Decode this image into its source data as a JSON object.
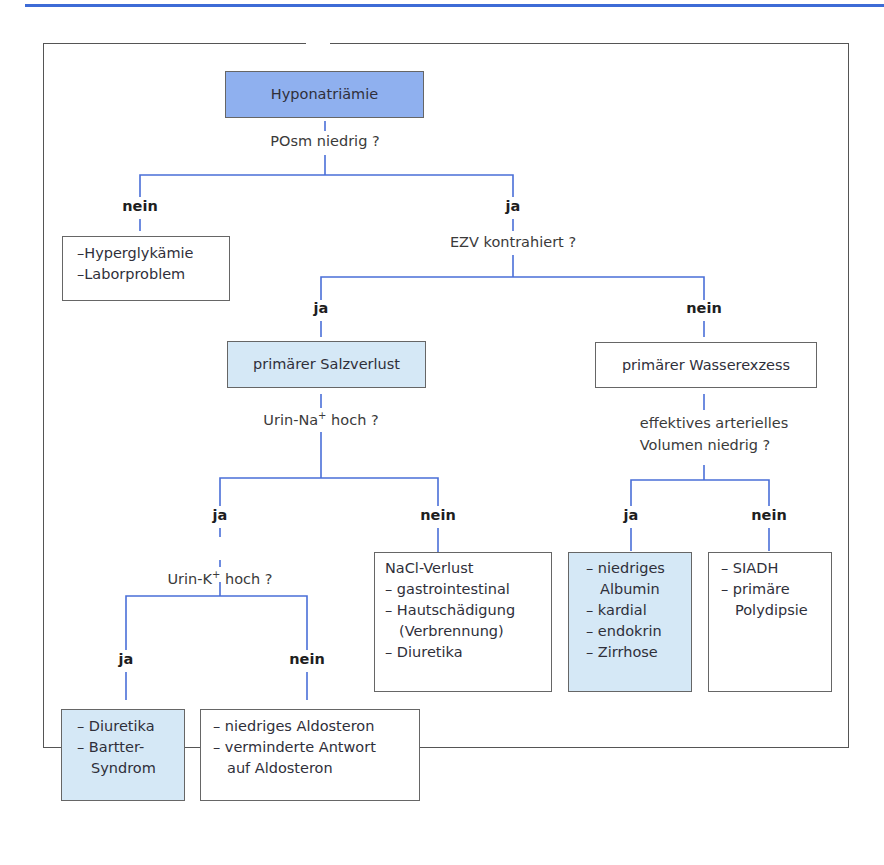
{
  "colors": {
    "line": "#4a6fd8",
    "root_box": "#8fb0ef",
    "highlight_box": "#d5e8f6",
    "top_rule": "#3d6bd6"
  },
  "root": {
    "label": "Hyponatriämie"
  },
  "q1": {
    "label": "POsm niedrig ?",
    "no": "nein",
    "yes": "ja"
  },
  "q1_no_box": {
    "items": [
      "–Hyperglykämie",
      "–Laborproblem"
    ]
  },
  "q2": {
    "label": "EZV kontrahiert ?",
    "yes": "ja",
    "no": "nein"
  },
  "salt_loss": {
    "label": "primärer Salzverlust"
  },
  "water_excess": {
    "label": "primärer Wasserexzess"
  },
  "q3": {
    "label_pre": "Urin-Na",
    "label_sup": "+",
    "label_post": " hoch ?",
    "yes": "ja",
    "no": "nein"
  },
  "q3_no_box": {
    "title": "NaCl-Verlust",
    "items": [
      "– gastrointestinal",
      "– Hautschädigung",
      "(Verbrennung)",
      "– Diuretika"
    ]
  },
  "q4": {
    "label_pre": "Urin-K",
    "label_sup": "+",
    "label_post": " hoch ?",
    "yes": "ja",
    "no": "nein"
  },
  "q4_yes_box": {
    "items": [
      "– Diuretika",
      "– Bartter-",
      "Syndrom"
    ]
  },
  "q4_no_box": {
    "items": [
      "– niedriges Aldosteron",
      "– verminderte Antwort",
      "auf Aldosteron"
    ]
  },
  "q5": {
    "label_line1": "effektives arterielles",
    "label_line2": "Volumen niedrig ?",
    "yes": "ja",
    "no": "nein"
  },
  "q5_yes_box": {
    "items": [
      "– niedriges",
      "Albumin",
      "– kardial",
      "– endokrin",
      "– Zirrhose"
    ]
  },
  "q5_no_box": {
    "items": [
      "– SIADH",
      "– primäre",
      "Polydipsie"
    ]
  }
}
